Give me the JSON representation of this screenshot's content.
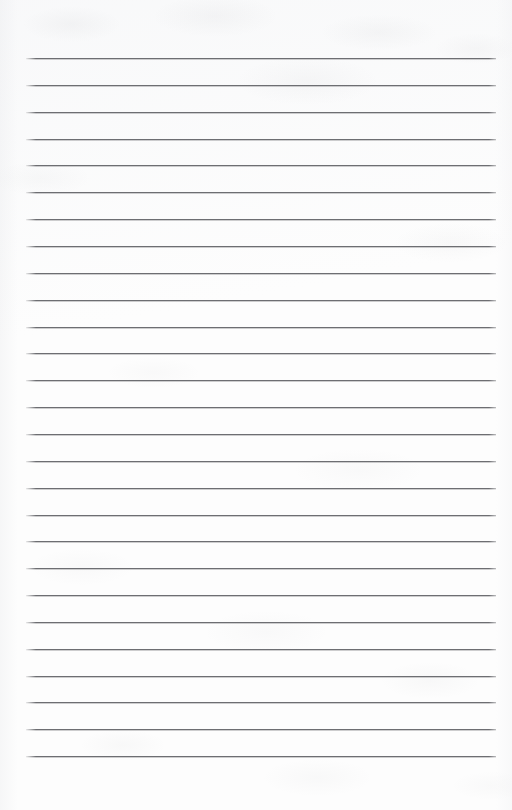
{
  "document": {
    "kind": "scanned-lined-paper",
    "title": "Blank lined notebook page",
    "page_width": 512,
    "page_height": 810,
    "background_color": "#fdfdfd",
    "has_text_content": false,
    "written_content": "",
    "header_text": "",
    "footer_text": "",
    "page_number_text": ""
  },
  "ruling": {
    "line_color": "#6d6e72",
    "line_thickness_px": 1.3,
    "line_count": 27,
    "left_margin_px": 26,
    "right_margin_px": 16,
    "line_length_px": 470,
    "first_line_y_px": 58,
    "last_line_y_px": 756,
    "line_spacing_px": 26.85,
    "top_blank_band_px": 58,
    "bottom_blank_band_px": 54,
    "lines_y": [
      58,
      84.9,
      111.7,
      138.6,
      165.4,
      192.3,
      219.1,
      246,
      272.8,
      299.7,
      326.5,
      353.4,
      380.2,
      407.1,
      433.9,
      460.8,
      487.6,
      514.5,
      541.3,
      568.2,
      595,
      621.9,
      648.7,
      675.6,
      702.4,
      729.3,
      756
    ],
    "line_labels": [
      "rule-line-1",
      "rule-line-2",
      "rule-line-3",
      "rule-line-4",
      "rule-line-5",
      "rule-line-6",
      "rule-line-7",
      "rule-line-8",
      "rule-line-9",
      "rule-line-10",
      "rule-line-11",
      "rule-line-12",
      "rule-line-13",
      "rule-line-14",
      "rule-line-15",
      "rule-line-16",
      "rule-line-17",
      "rule-line-18",
      "rule-line-19",
      "rule-line-20",
      "rule-line-21",
      "rule-line-22",
      "rule-line-23",
      "rule-line-24",
      "rule-line-25",
      "rule-line-26",
      "rule-line-27"
    ]
  },
  "texture": {
    "description": "faint grey scanner mottling",
    "mottle_color": "#787a80",
    "edge_shade_color": "#e6e7ea"
  }
}
